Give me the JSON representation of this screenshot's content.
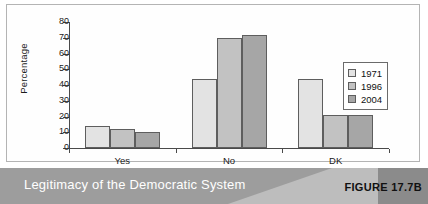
{
  "figure": {
    "caption": "Legitimacy of the Democratic System",
    "figure_label": "FIGURE 17.7B"
  },
  "chart_data": {
    "type": "bar",
    "title": "Legitimacy of the Democratic System",
    "xlabel": "",
    "ylabel": "Percentage",
    "categories": [
      "Yes",
      "No",
      "DK"
    ],
    "series": [
      {
        "name": "1971",
        "values": [
          14,
          44,
          44
        ],
        "color": "#e3e3e3"
      },
      {
        "name": "1996",
        "values": [
          12,
          70,
          21
        ],
        "color": "#c2c2c2"
      },
      {
        "name": "2004",
        "values": [
          10,
          72,
          21
        ],
        "color": "#a6a6a6"
      }
    ],
    "ylim": [
      0,
      80
    ],
    "yticks": [
      0,
      10,
      20,
      30,
      40,
      50,
      60,
      70,
      80
    ],
    "ytick_labels": [
      "0",
      "10",
      "20",
      "30",
      "40",
      "50",
      "60",
      "70",
      "80"
    ],
    "grid": false,
    "legend_position": "right"
  }
}
